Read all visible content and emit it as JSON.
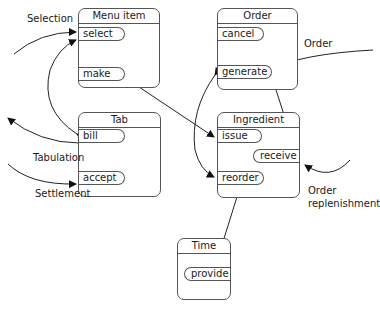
{
  "diagram": {
    "components": [
      {
        "id": "menu_item",
        "title": "Menu item",
        "operations": [
          "select",
          "make"
        ]
      },
      {
        "id": "order",
        "title": "Order",
        "operations": [
          "cancel",
          "generate"
        ]
      },
      {
        "id": "tab",
        "title": "Tab",
        "operations": [
          "bill",
          "accept"
        ]
      },
      {
        "id": "ingredient",
        "title": "Ingredient",
        "operations": [
          "issue",
          "receive",
          "reorder"
        ]
      },
      {
        "id": "time",
        "title": "Time",
        "operations": [
          "provide"
        ]
      }
    ],
    "external_labels": {
      "selection": "Selection",
      "order": "Order",
      "tabulation": "Tabulation",
      "settlement": "Settlement",
      "order_replenishment_line1": "Order",
      "order_replenishment_line2": "replenishment"
    },
    "connections": [
      {
        "from": "external",
        "to": "menu_item.select",
        "label": "Selection"
      },
      {
        "from": "tab.bill",
        "to": "menu_item.select",
        "bidirectional": true
      },
      {
        "from": "menu_item.make",
        "to": "ingredient.issue",
        "bidirectional": true
      },
      {
        "from": "external",
        "to": "order.generate",
        "label": "Order"
      },
      {
        "from": "order.generate",
        "to": "ingredient.reorder",
        "bidirectional": true
      },
      {
        "from": "order.cancel",
        "to": "ingredient.receive",
        "bidirectional": true
      },
      {
        "from": "tab.bill",
        "to": "external",
        "label": "Tabulation"
      },
      {
        "from": "external",
        "to": "tab.accept",
        "label": "Settlement"
      },
      {
        "from": "external",
        "to": "ingredient.receive",
        "label": "Order replenishment"
      },
      {
        "from": "ingredient.reorder",
        "to": "time.provide",
        "bidirectional": true
      }
    ]
  }
}
